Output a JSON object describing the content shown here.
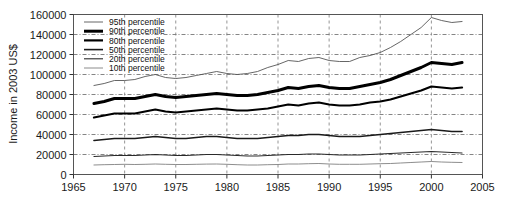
{
  "chart_data": {
    "type": "line",
    "title": "",
    "xlabel": "",
    "ylabel": "Income in 2003 US$",
    "xlim": [
      1965,
      2005
    ],
    "ylim": [
      0,
      160000
    ],
    "grid": true,
    "legend_position": "top-left",
    "xticks": [
      "1965",
      "1970",
      "1975",
      "1980",
      "1985",
      "1990",
      "1995",
      "2000",
      "2005"
    ],
    "xtick_values": [
      1965,
      1970,
      1975,
      1980,
      1985,
      1990,
      1995,
      2000,
      2005
    ],
    "yticks": [
      "0",
      "20000",
      "40000",
      "60000",
      "80000",
      "100000",
      "120000",
      "140000",
      "160000"
    ],
    "ytick_values": [
      0,
      20000,
      40000,
      60000,
      80000,
      100000,
      120000,
      140000,
      160000
    ],
    "x": [
      1967,
      1968,
      1969,
      1970,
      1971,
      1972,
      1973,
      1974,
      1975,
      1976,
      1977,
      1978,
      1979,
      1980,
      1981,
      1982,
      1983,
      1984,
      1985,
      1986,
      1987,
      1988,
      1989,
      1990,
      1991,
      1992,
      1993,
      1994,
      1995,
      1996,
      1997,
      1998,
      1999,
      2000,
      2001,
      2002,
      2003
    ],
    "series": [
      {
        "name": "95th percentile",
        "width": "thin",
        "color": "#555555",
        "values": [
          89000,
          91000,
          94000,
          94000,
          95000,
          98000,
          100000,
          97000,
          96000,
          97000,
          99000,
          101000,
          103000,
          101000,
          100000,
          101000,
          103000,
          107000,
          110000,
          114000,
          113000,
          116000,
          117000,
          114000,
          113000,
          113000,
          117000,
          119000,
          122000,
          127000,
          133000,
          140000,
          147000,
          157000,
          154000,
          152000,
          153000
        ]
      },
      {
        "name": "90th percentile",
        "width": "thick",
        "color": "#000000",
        "values": [
          71000,
          73000,
          76000,
          76000,
          76000,
          78000,
          80000,
          78000,
          77000,
          78000,
          79000,
          80000,
          81000,
          80000,
          79000,
          79000,
          80000,
          82000,
          84000,
          87000,
          86000,
          88000,
          89000,
          87000,
          86000,
          86000,
          88000,
          90000,
          92000,
          95000,
          99000,
          103000,
          107000,
          112000,
          111000,
          110000,
          112000
        ]
      },
      {
        "name": "80th percentile",
        "width": "medium-thick",
        "color": "#000000",
        "values": [
          57000,
          59000,
          61000,
          61000,
          61000,
          63000,
          65000,
          63000,
          62000,
          63000,
          64000,
          65000,
          66000,
          65000,
          64000,
          64000,
          65000,
          66000,
          68000,
          70000,
          69000,
          71000,
          72000,
          70000,
          69000,
          69000,
          70000,
          72000,
          73000,
          75000,
          78000,
          81000,
          84000,
          88000,
          87000,
          86000,
          87000
        ]
      },
      {
        "name": "50th percentile",
        "width": "medium",
        "color": "#1a1a1a",
        "values": [
          34000,
          35000,
          36000,
          36000,
          36000,
          37000,
          38000,
          37000,
          36000,
          36000,
          37000,
          38000,
          38000,
          37000,
          36000,
          36000,
          36000,
          37000,
          38000,
          39000,
          39000,
          40000,
          40000,
          39000,
          38000,
          38000,
          38000,
          39000,
          40000,
          41000,
          42000,
          43000,
          44000,
          45000,
          44000,
          43000,
          43000
        ]
      },
      {
        "name": "20th percentile",
        "width": "thin-dark",
        "color": "#2a2a2a",
        "values": [
          18000,
          18500,
          19000,
          19000,
          19000,
          19500,
          20000,
          19500,
          19000,
          19000,
          19500,
          20000,
          20000,
          19500,
          19000,
          18500,
          18500,
          19000,
          19500,
          20000,
          20000,
          20500,
          20500,
          20000,
          19500,
          19500,
          19500,
          20000,
          20500,
          21000,
          21500,
          22000,
          22500,
          23000,
          22500,
          22000,
          21500
        ]
      },
      {
        "name": "10th percentile",
        "width": "thin-light",
        "color": "#808080",
        "values": [
          9500,
          9800,
          10000,
          10200,
          10000,
          10200,
          10500,
          10200,
          10000,
          10000,
          10200,
          10400,
          10500,
          10200,
          9800,
          9500,
          9500,
          9800,
          10000,
          10500,
          10500,
          10800,
          11000,
          10500,
          10200,
          10200,
          10200,
          10500,
          10800,
          11000,
          11500,
          12000,
          12500,
          13000,
          12500,
          12200,
          12000
        ]
      }
    ]
  },
  "legend": {
    "items": [
      {
        "label": "95th percentile"
      },
      {
        "label": "90th percentile"
      },
      {
        "label": "80th percentile"
      },
      {
        "label": "50th percentile"
      },
      {
        "label": "20th percentile"
      },
      {
        "label": "10th percentile"
      }
    ]
  }
}
